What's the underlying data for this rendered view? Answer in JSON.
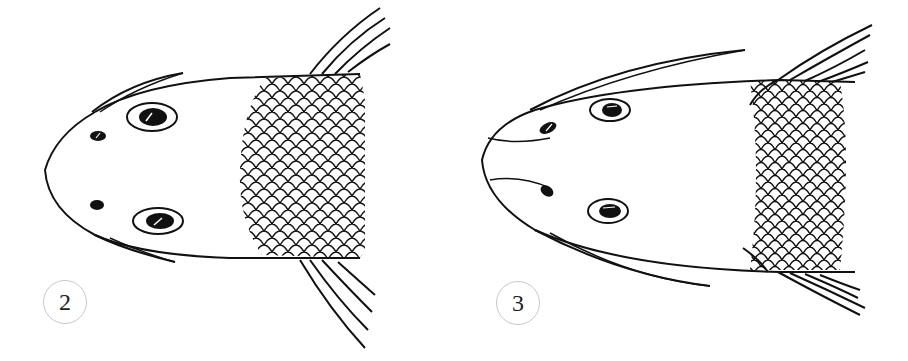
{
  "figures": [
    {
      "id": "fig2",
      "label": "2",
      "description": "Dorsal view of fish head with rounded snout, short barbels, nostrils and eyes, scaled body section and fins"
    },
    {
      "id": "fig3",
      "label": "3",
      "description": "Dorsal view of fish head with pointed snout, long barbels, nostrils and eyes, scaled body section and fins"
    }
  ],
  "colors": {
    "line": "#111111",
    "background": "#ffffff",
    "label_border": "#c8c8c8"
  }
}
